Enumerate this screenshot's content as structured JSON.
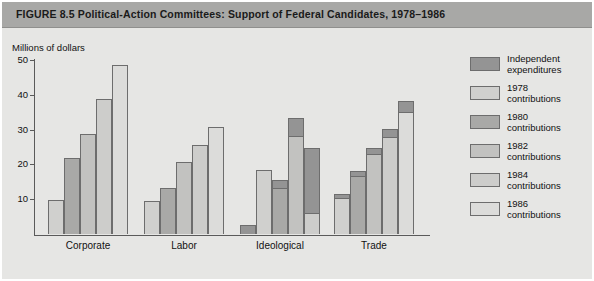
{
  "figure": {
    "title": "FIGURE 8.5  Political-Action Committees: Support of Federal Candidates, 1978–1986"
  },
  "colors": {
    "banner": "#a8a8a6",
    "panel": "#e6e6e4",
    "axis": "#5a5a5a",
    "bar_outline": "#6d6d6d",
    "independent": "#949494",
    "c1978": "#d0d0ce",
    "c1980": "#a9a9a7",
    "c1982": "#c2c2c0",
    "c1984": "#cdcdcb",
    "c1986": "#dcdcda"
  },
  "chart_data": {
    "type": "bar",
    "title": "Political-Action Committees: Support of Federal Candidates, 1978–1986",
    "xlabel": "",
    "ylabel": "Millions of dollars",
    "ylim": [
      0,
      50
    ],
    "yticks": [
      0,
      10,
      20,
      30,
      40,
      50
    ],
    "ytick_labels": [
      "",
      "10",
      "20",
      "30",
      "40",
      "50"
    ],
    "grid": false,
    "legend_position": "right",
    "categories": [
      "Corporate",
      "Labor",
      "Ideological",
      "Trade"
    ],
    "series": [
      {
        "name": "Independent expenditures",
        "color": "#949494",
        "values": [
          0,
          0,
          2.5,
          0
        ],
        "stacked_on_contributions": {
          "Ideological": [
            0,
            2.7,
            5.6,
            18.8,
            6.3,
            0
          ],
          "Trade": [
            1.4,
            1.8,
            2.2,
            2.6,
            3.5
          ]
        }
      },
      {
        "name": "1978 contributions",
        "color": "#d0d0ce",
        "values": [
          9.8,
          9.5,
          18.3,
          11.6
        ]
      },
      {
        "name": "1980 contributions",
        "color": "#a9a9a7",
        "values": [
          21.8,
          13.3,
          15.6,
          18.2
        ]
      },
      {
        "name": "1982 contributions",
        "color": "#c2c2c0",
        "values": [
          28.8,
          20.6,
          33.4,
          24.8
        ]
      },
      {
        "name": "1984 contributions",
        "color": "#cdcdcb",
        "values": [
          38.8,
          25.5,
          24.6,
          30.2
        ]
      },
      {
        "name": "1986 contributions",
        "color": "#dcdcda",
        "values": [
          48.5,
          30.7,
          0,
          38.3
        ]
      }
    ]
  },
  "legend": {
    "items": [
      {
        "label": "Independent\nexpenditures",
        "color": "#949494"
      },
      {
        "label": "1978\ncontributions",
        "color": "#d0d0ce"
      },
      {
        "label": "1980\ncontributions",
        "color": "#a9a9a7"
      },
      {
        "label": "1982\ncontributions",
        "color": "#c2c2c0"
      },
      {
        "label": "1984\ncontributions",
        "color": "#cdcdcb"
      },
      {
        "label": "1986\ncontributions",
        "color": "#dcdcda"
      }
    ]
  }
}
